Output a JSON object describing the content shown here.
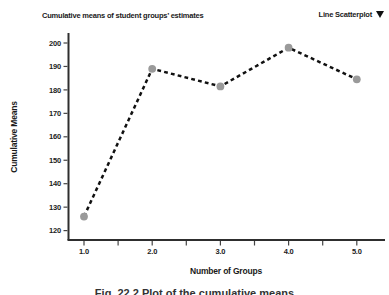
{
  "header": {
    "title": "Cumulative means of student groups’ estimates",
    "chart_type_label": "Line Scatterplot",
    "dropdown_icon": "filled-down-triangle"
  },
  "chart_data": {
    "type": "line",
    "title": "Cumulative means of student groups’ estimates",
    "x": [
      1.0,
      2.0,
      3.0,
      4.0,
      5.0
    ],
    "x_tick_labels": [
      "1.0",
      "2.0",
      "3.0",
      "4.0",
      "5.0"
    ],
    "values": [
      126,
      189,
      181.5,
      198,
      184.5
    ],
    "xlabel": "Number of Groups",
    "ylabel": "Cumulative Means",
    "ylim": [
      120,
      200
    ],
    "xlim": [
      1.0,
      5.0
    ],
    "y_ticks": [
      120,
      130,
      140,
      150,
      160,
      170,
      180,
      190,
      200
    ],
    "x_minor_tick_step": 0.5,
    "grid": false,
    "legend": "none",
    "line_style": "dashed",
    "line_color": "#111111",
    "marker_color": "#9a9a9a",
    "axis_color": "#2e2e2e"
  },
  "caption": "Fig. 22.2 Plot of the cumulative means"
}
